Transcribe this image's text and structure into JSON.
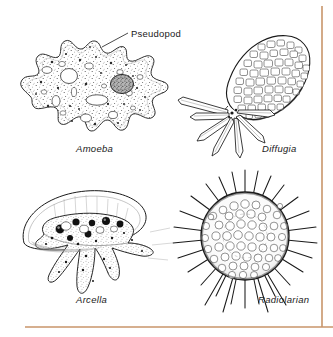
{
  "figure": {
    "background_color": "#ffffff",
    "ink_color": "#1a1a1a",
    "rule_color": "#c8956a",
    "callout": {
      "label": "Pseudopod",
      "style": "upright"
    },
    "organisms": [
      {
        "id": "amoeba",
        "label": "Amoeba",
        "style": "italic",
        "description": "lobed stippled cell with nucleus and vacuoles",
        "label_x": 76,
        "label_y": 152
      },
      {
        "id": "diffugia",
        "label": "Diffugia",
        "style": "italic",
        "description": "pear-shaped test of cemented particles with pointed pseudopodia",
        "label_x": 262,
        "label_y": 152
      },
      {
        "id": "arcella",
        "label": "Arcella",
        "style": "italic",
        "description": "dome-shaped test with granular cell body and finger-like pseudopodia",
        "label_x": 76,
        "label_y": 303
      },
      {
        "id": "radiolarian",
        "label": "Radiolarian",
        "style": "italic",
        "description": "spherical porous lattice shell with long radiating spines",
        "label_x": 258,
        "label_y": 303
      }
    ],
    "rules": {
      "vertical_right": {
        "x": 322,
        "y1": 6,
        "y2": 327
      },
      "horizontal_bottom": {
        "y": 327,
        "x1": 25,
        "x2": 333
      }
    }
  }
}
